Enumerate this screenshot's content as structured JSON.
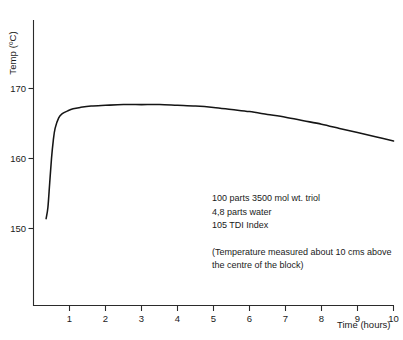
{
  "chart_data": {
    "type": "line",
    "title": "",
    "xlabel": "Time (hours)",
    "ylabel": "Temp (ºC)",
    "xlim": [
      0,
      10
    ],
    "ylim": [
      146,
      172.5
    ],
    "grid": false,
    "legend": "none",
    "xticks": [
      1,
      2,
      3,
      4,
      5,
      6,
      7,
      8,
      9,
      10
    ],
    "xtick_labels": [
      "1",
      "2",
      "3",
      "4",
      "5",
      "6",
      "7",
      "8",
      "9",
      "10"
    ],
    "yticks": [
      150,
      160,
      170
    ],
    "ytick_labels": [
      "150",
      "160",
      "170"
    ],
    "series": [
      {
        "name": "Block temperature",
        "x": [
          0.35,
          0.4,
          0.45,
          0.5,
          0.55,
          0.6,
          0.7,
          0.8,
          0.95,
          1.1,
          1.3,
          1.6,
          2.0,
          2.5,
          3.0,
          3.5,
          4.0,
          4.5,
          5.0,
          5.5,
          6.0,
          6.5,
          7.0,
          7.5,
          8.0,
          8.5,
          9.0,
          9.5,
          10.0
        ],
        "values": [
          151.4,
          153.0,
          156.5,
          160.0,
          162.6,
          164.3,
          165.8,
          166.4,
          166.8,
          167.1,
          167.3,
          167.5,
          167.6,
          167.7,
          167.7,
          167.7,
          167.6,
          167.5,
          167.3,
          167.0,
          166.7,
          166.3,
          165.9,
          165.4,
          164.9,
          164.3,
          163.7,
          163.1,
          162.5
        ]
      }
    ],
    "annotations": {
      "formulation": [
        "100 parts 3500 mol wt. triol",
        "4,8 parts water",
        "105 TDI Index"
      ],
      "note": [
        "(Temperature measured about 10 cms above",
        "the centre of the block)"
      ]
    }
  },
  "axes": {
    "y_axis_label": "Temp (ºC)",
    "x_axis_label": "Time (hours)"
  },
  "colors": {
    "curve": "#151515",
    "axis": "#2b2b2b",
    "text": "#1a1a1a",
    "background": "#ffffff"
  }
}
